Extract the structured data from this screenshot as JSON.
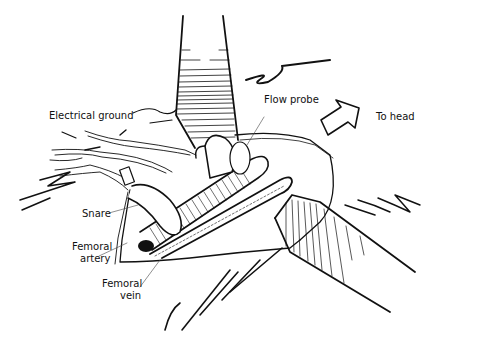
{
  "figure": {
    "type": "surgical illustration",
    "labels": {
      "electrical_ground": "Electrical ground",
      "flow_probe": "Flow probe",
      "to_head": "To head",
      "snare": "Snare",
      "femoral_artery_1": "Femoral",
      "femoral_artery_2": "artery",
      "femoral_vein_1": "Femoral",
      "femoral_vein_2": "vein"
    },
    "colors": {
      "ink": "#111111",
      "background": "#ffffff"
    }
  }
}
